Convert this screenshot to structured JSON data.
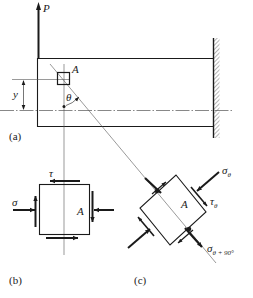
{
  "figure": {
    "colors": {
      "ink": "#1a1a1a",
      "thin_line": "#555555",
      "background": "#ffffff"
    }
  },
  "panel_a": {
    "caption": "(a)",
    "load_label": "P",
    "point_label": "A",
    "dimension_label": "y",
    "angle_label": "θ"
  },
  "panel_b": {
    "caption": "(b)",
    "normal_stress_label": "σ",
    "shear_stress_label": "τ",
    "point_label": "A"
  },
  "panel_c": {
    "caption": "(c)",
    "point_label": "A",
    "normal_stress_label": "σ",
    "normal_stress_sub": "θ",
    "shear_stress_label": "τ",
    "shear_stress_sub": "θ",
    "normal_stress_90_label": "σ",
    "normal_stress_90_sub": "θ + 90°"
  }
}
